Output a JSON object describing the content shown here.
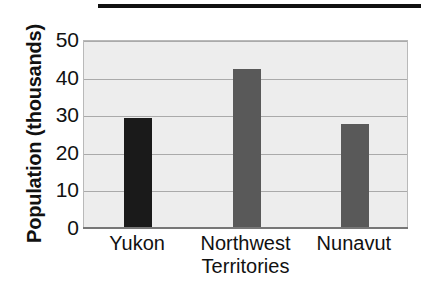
{
  "figure": {
    "top_rule": "decorative-black-rule"
  },
  "chart_data": {
    "type": "bar",
    "title": "",
    "xlabel": "",
    "ylabel": "Population (thousands)",
    "categories": [
      "Yukon",
      "Northwest Territories",
      "Nunavut"
    ],
    "category_lines": [
      [
        "Yukon"
      ],
      [
        "Northwest",
        "Territories"
      ],
      [
        "Nunavut"
      ]
    ],
    "values": [
      29,
      42,
      27.5
    ],
    "ylim": [
      0,
      50
    ],
    "ytick_labels": [
      "50",
      "40",
      "30",
      "20",
      "10",
      "0"
    ],
    "ytick_values": [
      50,
      40,
      30,
      20,
      10,
      0
    ],
    "grid": true,
    "legend": "none",
    "bar_colors": [
      "#1a1a1a",
      "#595959",
      "#595959"
    ],
    "plot_background": "#ededed",
    "gridline_color": "#aaaaaa"
  }
}
